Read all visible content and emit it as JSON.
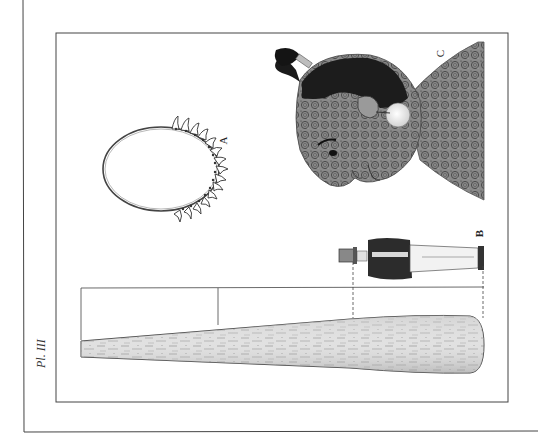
{
  "plate": {
    "number_label": "Pl. III",
    "orientation": "rotated 90° counter-clockwise",
    "background_color": "#ffffff",
    "line_color": "#333333"
  },
  "figures": [
    {
      "id": "A",
      "label": "A",
      "description": "necklace of teeth (oval cord with hanging teeth)"
    },
    {
      "id": "B",
      "label": "B",
      "description": "standing man in coat and top hat, shown for scale"
    },
    {
      "id": "C",
      "label": "C",
      "description": "tattooed head with topknot and ear ornament"
    }
  ],
  "club": {
    "description": "large wooden club with grain texture, tapering shaft"
  },
  "measurement_lines": {
    "description": "horizontal scale line with vertical ticks linking club length to man's height"
  }
}
